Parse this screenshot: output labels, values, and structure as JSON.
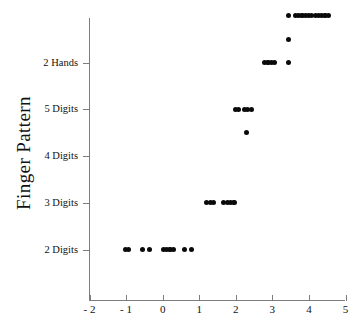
{
  "chart_data": {
    "type": "scatter",
    "title": "",
    "subtitle": "",
    "xlabel": "",
    "ylabel": "Finger Pattern",
    "grid": false,
    "legend": false,
    "legend_position": "none",
    "xlim": [
      -2,
      5
    ],
    "xticks": [
      -2,
      -1,
      0,
      1,
      2,
      3,
      4,
      5
    ],
    "xticklabels": [
      "- 2",
      "- 1",
      "0",
      "1",
      "2",
      "3",
      "4",
      "5"
    ],
    "ylim": [
      0.2,
      6.0
    ],
    "yticks": [
      1,
      2,
      3,
      4,
      5
    ],
    "yticklabels": [
      "2 Digits",
      "3 Digits",
      "4 Digits",
      "5 Digits",
      "2 Hands"
    ],
    "ycategories": [
      "2 Digits",
      "3 Digits",
      "4 Digits",
      "5 Digits",
      "2 Hands"
    ],
    "marker": "filled-circle",
    "marker_color": "#0a0a0a",
    "marker_size": 5,
    "series": [
      {
        "name": "observations",
        "points": [
          {
            "x": -1.02,
            "y": 1
          },
          {
            "x": -0.93,
            "y": 1
          },
          {
            "x": -0.55,
            "y": 1
          },
          {
            "x": -0.36,
            "y": 1
          },
          {
            "x": 0.02,
            "y": 1
          },
          {
            "x": 0.11,
            "y": 1
          },
          {
            "x": 0.2,
            "y": 1
          },
          {
            "x": 0.29,
            "y": 1
          },
          {
            "x": 0.6,
            "y": 1
          },
          {
            "x": 0.79,
            "y": 1
          },
          {
            "x": 1.2,
            "y": 2
          },
          {
            "x": 1.3,
            "y": 2
          },
          {
            "x": 1.39,
            "y": 2
          },
          {
            "x": 1.67,
            "y": 2
          },
          {
            "x": 1.77,
            "y": 2
          },
          {
            "x": 1.86,
            "y": 2
          },
          {
            "x": 1.95,
            "y": 2
          },
          {
            "x": 2.3,
            "y": 3.5
          },
          {
            "x": 1.99,
            "y": 4
          },
          {
            "x": 2.08,
            "y": 4
          },
          {
            "x": 2.24,
            "y": 4
          },
          {
            "x": 2.33,
            "y": 4
          },
          {
            "x": 2.42,
            "y": 4
          },
          {
            "x": 2.79,
            "y": 5
          },
          {
            "x": 2.88,
            "y": 5
          },
          {
            "x": 2.97,
            "y": 5
          },
          {
            "x": 3.06,
            "y": 5
          },
          {
            "x": 3.45,
            "y": 5
          },
          {
            "x": 3.45,
            "y": 5.5
          },
          {
            "x": 3.44,
            "y": 6
          },
          {
            "x": 3.63,
            "y": 6
          },
          {
            "x": 3.72,
            "y": 6
          },
          {
            "x": 3.81,
            "y": 6
          },
          {
            "x": 3.9,
            "y": 6
          },
          {
            "x": 3.99,
            "y": 6
          },
          {
            "x": 4.08,
            "y": 6
          },
          {
            "x": 4.17,
            "y": 6
          },
          {
            "x": 4.26,
            "y": 6
          },
          {
            "x": 4.35,
            "y": 6
          },
          {
            "x": 4.44,
            "y": 6
          },
          {
            "x": 4.53,
            "y": 6
          }
        ]
      }
    ]
  },
  "axes": {
    "y_title": "Finger Pattern",
    "y_tick_labels": [
      "2 Hands",
      "5 Digits",
      "4 Digits",
      "3 Digits",
      "2 Digits"
    ],
    "x_tick_labels": [
      "- 2",
      "- 1",
      "0",
      "1",
      "2",
      "3",
      "4",
      "5"
    ],
    "axis_color": "#7d7d7d"
  }
}
